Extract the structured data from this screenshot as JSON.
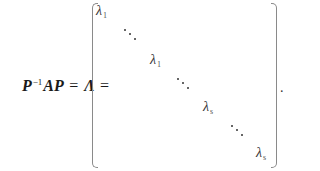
{
  "equation": {
    "lhs": {
      "P": "P",
      "inverse_sup": "−1",
      "AP": "AP",
      "equals_1": "=",
      "Lambda": "Λ",
      "equals_2": "="
    },
    "matrix": {
      "type": "diagonal",
      "diagonal_entries": [
        {
          "symbol": "λ",
          "subscript": "1"
        },
        {
          "symbol": "⋱",
          "subscript": ""
        },
        {
          "symbol": "λ",
          "subscript": "1"
        },
        {
          "symbol": "⋱",
          "subscript": ""
        },
        {
          "symbol": "λ",
          "subscript": "s"
        },
        {
          "symbol": "⋱",
          "subscript": ""
        },
        {
          "symbol": "λ",
          "subscript": "s"
        }
      ]
    },
    "trailing_punctuation": "."
  }
}
